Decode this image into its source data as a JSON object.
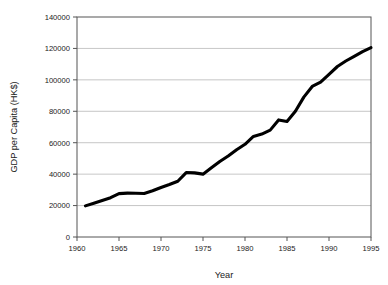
{
  "chart_data": {
    "type": "line",
    "title": "",
    "xlabel": "Year",
    "ylabel": "GDP per Capita (HK$)",
    "xlim": [
      1960,
      1995
    ],
    "ylim": [
      0,
      140000
    ],
    "xticks": [
      1960,
      1965,
      1970,
      1975,
      1980,
      1985,
      1990,
      1995
    ],
    "xtick_labels": [
      "1960",
      "1965",
      "1970",
      "1975",
      "1980",
      "1985",
      "1990",
      "1995"
    ],
    "yticks": [
      0,
      20000,
      40000,
      60000,
      80000,
      100000,
      120000,
      140000
    ],
    "ytick_labels": [
      "0",
      "20000",
      "40000",
      "60000",
      "80000",
      "100000",
      "120000",
      "140000"
    ],
    "grid": "horizontal",
    "legend": "none",
    "line_color": "#000000",
    "grid_color": "#b8b8b8",
    "axis_color": "#555555",
    "background": "#ffffff",
    "series": [
      {
        "name": "GDP per Capita (HK$)",
        "x": [
          1961,
          1962,
          1963,
          1964,
          1965,
          1966,
          1967,
          1968,
          1969,
          1970,
          1971,
          1972,
          1973,
          1974,
          1975,
          1976,
          1977,
          1978,
          1979,
          1980,
          1981,
          1982,
          1983,
          1984,
          1985,
          1986,
          1987,
          1988,
          1989,
          1990,
          1991,
          1992,
          1993,
          1994,
          1995
        ],
        "values": [
          19800,
          21500,
          23200,
          25000,
          27600,
          27900,
          27800,
          27700,
          29400,
          31500,
          33400,
          35500,
          41000,
          40800,
          40000,
          44000,
          48000,
          51500,
          55500,
          59000,
          64000,
          65500,
          68000,
          74500,
          73500,
          80000,
          89000,
          95800,
          98500,
          103500,
          108500,
          112000,
          115000,
          118000,
          120500
        ]
      }
    ]
  },
  "axis_titles": {
    "x": "Year",
    "y": "GDP per Capita (HK$)"
  }
}
